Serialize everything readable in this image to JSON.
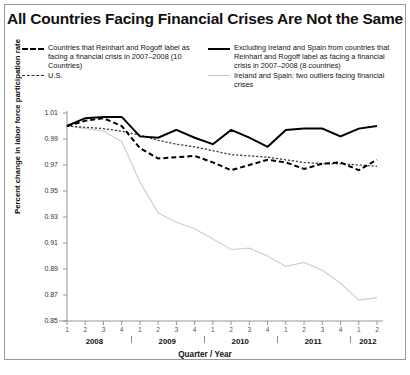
{
  "title": "All Countries Facing Financial Crises Are Not the Same",
  "legend": {
    "left": [
      {
        "style": "dashed-thick",
        "label": "Countries that Reinhart and Rogoff label as facing a financial crisis in 2007–2008 (10 Countries)"
      },
      {
        "style": "dashed-thin",
        "label": "U.S."
      }
    ],
    "right": [
      {
        "style": "solid",
        "label": "Excluding Ireland and Spain from countries that Reinhart and Rogoff label as facing a financial crisis in 2007–2008 (8 countries)"
      },
      {
        "style": "gray",
        "label": "Ireland and Spain: two outliers facing financial crises"
      }
    ]
  },
  "chart_data": {
    "type": "line",
    "title": "All Countries Facing Financial Crises Are Not the Same",
    "xlabel": "Quarter / Year",
    "ylabel": "Percent change in labor force participation rate",
    "ylim": [
      0.85,
      1.01
    ],
    "yticks": [
      "1.01",
      "0.99",
      "0.97",
      "0.95",
      "0.93",
      "0.91",
      "0.89",
      "0.87",
      "0.85"
    ],
    "ytick_values": [
      1.01,
      0.99,
      0.97,
      0.95,
      0.93,
      0.91,
      0.89,
      0.87,
      0.85
    ],
    "grid": false,
    "legend_position": "top",
    "x": [
      "2008 Q1",
      "2008 Q2",
      "2008 Q3",
      "2008 Q4",
      "2009 Q1",
      "2009 Q2",
      "2009 Q3",
      "2009 Q4",
      "2010 Q1",
      "2010 Q2",
      "2010 Q3",
      "2010 Q4",
      "2011 Q1",
      "2011 Q2",
      "2011 Q3",
      "2011 Q4",
      "2012 Q1",
      "2012 Q2"
    ],
    "quarter_labels": [
      "1",
      "2",
      "3",
      "4",
      "1",
      "2",
      "3",
      "4",
      "1",
      "2",
      "3",
      "4",
      "1",
      "2",
      "3",
      "4",
      "1",
      "2"
    ],
    "years": [
      {
        "label": "2008",
        "quarters": 4
      },
      {
        "label": "2009",
        "quarters": 4
      },
      {
        "label": "2010",
        "quarters": 4
      },
      {
        "label": "2011",
        "quarters": 4
      },
      {
        "label": "2012",
        "quarters": 2
      }
    ],
    "series": [
      {
        "name": "Countries that Reinhart and Rogoff label as facing a financial crisis in 2007–2008 (10 Countries)",
        "style": "dashed-thick",
        "color": "#000000",
        "values": [
          1.0,
          1.004,
          1.006,
          1.0,
          0.983,
          0.975,
          0.976,
          0.977,
          0.972,
          0.966,
          0.97,
          0.974,
          0.972,
          0.967,
          0.971,
          0.972,
          0.966,
          0.974
        ]
      },
      {
        "name": "U.S.",
        "style": "dashed-thin",
        "color": "#3a3a3a",
        "values": [
          1.0,
          0.999,
          0.998,
          0.996,
          0.993,
          0.989,
          0.986,
          0.984,
          0.981,
          0.978,
          0.977,
          0.976,
          0.974,
          0.972,
          0.971,
          0.971,
          0.97,
          0.969
        ]
      },
      {
        "name": "Excluding Ireland and Spain from countries that Reinhart and Rogoff label as facing a financial crisis in 2007–2008 (8 countries)",
        "style": "solid",
        "color": "#000000",
        "values": [
          1.0,
          1.006,
          1.007,
          1.007,
          0.992,
          0.991,
          0.997,
          0.991,
          0.986,
          0.997,
          0.991,
          0.984,
          0.997,
          0.998,
          0.998,
          0.992,
          0.998,
          1.0
        ]
      },
      {
        "name": "Ireland and Spain: two outliers facing financial crises",
        "style": "gray",
        "color": "#cfcfcf",
        "values": [
          1.0,
          0.998,
          0.996,
          0.988,
          0.957,
          0.933,
          0.926,
          0.921,
          0.913,
          0.905,
          0.906,
          0.9,
          0.892,
          0.895,
          0.889,
          0.879,
          0.866,
          0.868
        ]
      }
    ]
  }
}
